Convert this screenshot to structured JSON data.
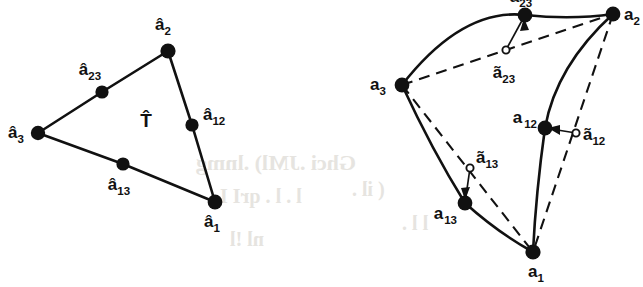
{
  "figure": {
    "background_color": "#ffffff",
    "ink_color": "#111111",
    "ghost_color": "#e6e4e0"
  },
  "left_panel": {
    "name": "reference-triangle",
    "region_label": "T̂",
    "vertices": [
      {
        "id": "a1",
        "label": "â",
        "sub": "1",
        "x": 215,
        "y": 202,
        "marker": "filled",
        "label_x": 212,
        "label_y": 227,
        "label_anchor": "middle"
      },
      {
        "id": "a2",
        "label": "â",
        "sub": "2",
        "x": 168,
        "y": 51,
        "marker": "filled",
        "label_x": 163,
        "label_y": 30,
        "label_anchor": "middle"
      },
      {
        "id": "a3",
        "label": "â",
        "sub": "3",
        "x": 38,
        "y": 133,
        "marker": "filled",
        "label_x": 16,
        "label_y": 138,
        "label_anchor": "middle"
      }
    ],
    "midpoints": [
      {
        "id": "a12",
        "label": "â",
        "sub": "12",
        "x": 192,
        "y": 125,
        "marker": "filled",
        "label_x": 203,
        "label_y": 120,
        "label_anchor": "start"
      },
      {
        "id": "a13",
        "label": "â",
        "sub": "13",
        "x": 123,
        "y": 164,
        "marker": "filled",
        "label_x": 119,
        "label_y": 190,
        "label_anchor": "middle"
      },
      {
        "id": "a23",
        "label": "â",
        "sub": "23",
        "x": 102,
        "y": 92,
        "marker": "filled",
        "label_x": 90,
        "label_y": 75,
        "label_anchor": "middle"
      }
    ],
    "edges": [
      {
        "from": "a3",
        "to": "a2",
        "style": "solid"
      },
      {
        "from": "a2",
        "to": "a1",
        "style": "solid"
      },
      {
        "from": "a3",
        "to": "a1",
        "style": "solid"
      }
    ],
    "region_label_x": 146,
    "region_label_y": 127
  },
  "right_panel": {
    "name": "curved-triangle",
    "vertices": [
      {
        "id": "a1",
        "label": "a",
        "sub": "1",
        "x": 533,
        "y": 252,
        "marker": "filled",
        "label_x": 536,
        "label_y": 277,
        "label_anchor": "middle"
      },
      {
        "id": "a2",
        "label": "a",
        "sub": "2",
        "x": 613,
        "y": 14,
        "marker": "filled",
        "label_x": 624,
        "label_y": 18,
        "label_anchor": "start"
      },
      {
        "id": "a3",
        "label": "a",
        "sub": "3",
        "x": 402,
        "y": 85,
        "marker": "filled",
        "label_x": 378,
        "label_y": 82,
        "label_anchor": "middle"
      }
    ],
    "curve_nodes": [
      {
        "id": "a12",
        "label": "a",
        "sub": "12",
        "x": 545,
        "y": 128,
        "marker": "filled",
        "label_x": 535,
        "label_y": 123,
        "label_anchor": "end"
      },
      {
        "id": "a13",
        "label": "a",
        "sub": "13",
        "x": 465,
        "y": 203,
        "marker": "filled",
        "label_x": 455,
        "label_y": 218,
        "label_anchor": "end"
      },
      {
        "id": "a23",
        "label": "a",
        "sub": "23",
        "x": 525,
        "y": 15,
        "marker": "filled",
        "label_x": 521,
        "label_y": -3,
        "label_anchor": "middle"
      }
    ],
    "chord_midpoints": [
      {
        "id": "t12",
        "label": "ã",
        "sub": "12",
        "x": 576,
        "y": 133,
        "marker": "open",
        "label_x": 583,
        "label_y": 139,
        "label_anchor": "start"
      },
      {
        "id": "t13",
        "label": "ã",
        "sub": "13",
        "x": 470,
        "y": 168,
        "marker": "open",
        "label_x": 477,
        "label_y": 162,
        "label_anchor": "start"
      },
      {
        "id": "t23",
        "label": "ã",
        "sub": "23",
        "x": 506,
        "y": 50,
        "marker": "open",
        "label_x": 504,
        "label_y": 76,
        "label_anchor": "middle"
      }
    ],
    "curved_edges": [
      {
        "from": "a3",
        "via": "a23",
        "to": "a2",
        "style": "solid-curve"
      },
      {
        "from": "a2",
        "via": "a12",
        "to": "a1",
        "style": "solid-curve"
      },
      {
        "from": "a3",
        "via": "a13",
        "to": "a1",
        "style": "solid-curve"
      }
    ],
    "chords": [
      {
        "from": "a3",
        "to": "a2",
        "style": "dashed"
      },
      {
        "from": "a2",
        "to": "a1",
        "style": "dashed"
      },
      {
        "from": "a3",
        "to": "a1",
        "style": "dashed"
      }
    ],
    "connectors": [
      {
        "from": "a23",
        "to": "t23"
      },
      {
        "from": "a12",
        "to": "t12"
      },
      {
        "from": "a13",
        "to": "t13"
      }
    ]
  },
  "bleed_through": [
    {
      "text": "Ghci .JMl) .lnmg",
      "x": 196,
      "y": 150,
      "size": 22,
      "rot": 0
    },
    {
      "text": "l . l . qrI I .",
      "x": 210,
      "y": 185,
      "size": 20,
      "rot": 0
    },
    {
      "text": "nl !l",
      "x": 230,
      "y": 228,
      "size": 20,
      "rot": 0
    },
    {
      "text": "( il .",
      "x": 352,
      "y": 178,
      "size": 20,
      "rot": 0
    },
    {
      "text": "l l .",
      "x": 402,
      "y": 212,
      "size": 20,
      "rot": 0
    }
  ]
}
